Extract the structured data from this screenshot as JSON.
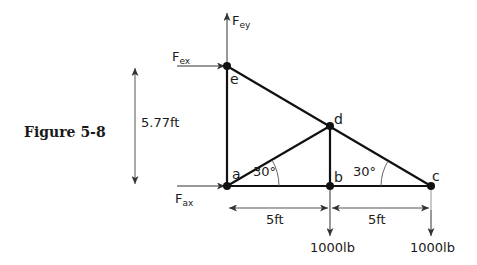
{
  "figure": {
    "caption": "Figure 5-8"
  },
  "nodes": {
    "a": {
      "label": "a",
      "x": 227,
      "y": 186
    },
    "b": {
      "label": "b",
      "x": 330,
      "y": 186
    },
    "c": {
      "label": "c",
      "x": 431,
      "y": 186
    },
    "d": {
      "label": "d",
      "x": 330,
      "y": 126
    },
    "e": {
      "label": "e",
      "x": 227,
      "y": 66
    }
  },
  "members": [
    "a-e",
    "a-b",
    "b-c",
    "a-d",
    "b-d",
    "d-c",
    "e-d"
  ],
  "forces": {
    "fey": {
      "main": "F",
      "sub": "ey"
    },
    "fex": {
      "main": "F",
      "sub": "ex"
    },
    "fax": {
      "main": "F",
      "sub": "ax"
    },
    "load_b": "1000lb",
    "load_c": "1000lb"
  },
  "dimensions": {
    "height": "5.77ft",
    "span_ab": "5ft",
    "span_bc": "5ft"
  },
  "angles": {
    "at_a": "30°",
    "at_c": "30°"
  },
  "colors": {
    "member": "#111111",
    "dimension": "#555555",
    "text": "#1a1a1a"
  }
}
